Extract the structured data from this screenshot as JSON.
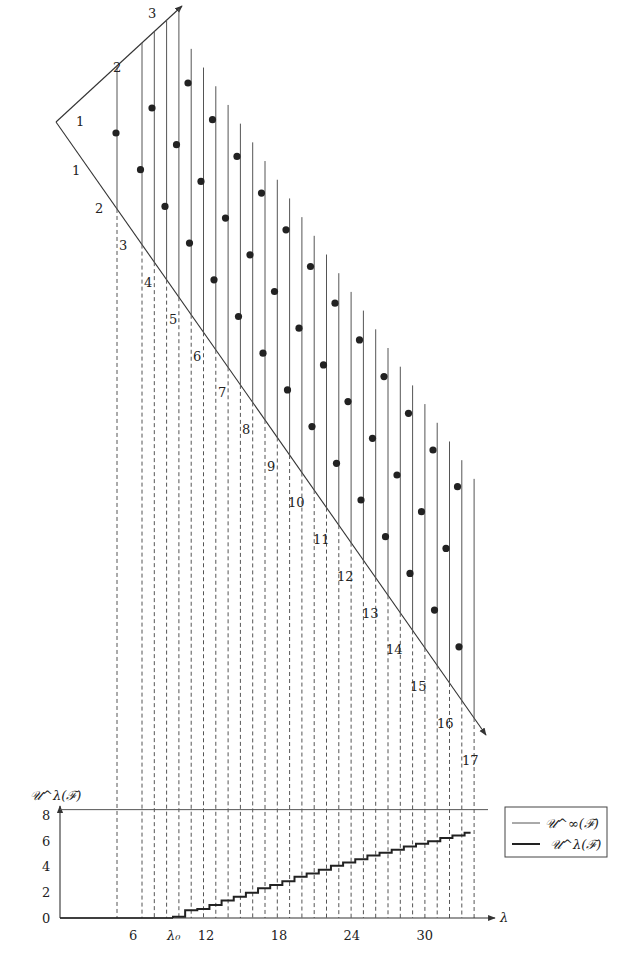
{
  "diagram": {
    "top_edge_labels": [
      "1",
      "2",
      "3"
    ],
    "left_edge_labels": [
      "1",
      "2",
      "3",
      "4",
      "5",
      "6",
      "7",
      "8",
      "9",
      "10",
      "11",
      "12",
      "13",
      "14",
      "15",
      "16",
      "17"
    ],
    "vertical_line_count": 29,
    "dot_rows": 3
  },
  "chart_data": {
    "type": "line",
    "ylabel": "𝒰^λ(ℱ)",
    "xlabel": "λ",
    "ylim": [
      0,
      8.5
    ],
    "yticks": [
      "0",
      "2",
      "4",
      "6",
      "8"
    ],
    "xticks": [
      {
        "value": 6,
        "label": "6"
      },
      {
        "value": 9.3,
        "label": "λ₀"
      },
      {
        "value": 12,
        "label": "12"
      },
      {
        "value": 18,
        "label": "18"
      },
      {
        "value": 24,
        "label": "24"
      },
      {
        "value": 30,
        "label": "30"
      }
    ],
    "xlim": [
      0,
      36
    ],
    "series": [
      {
        "name": "𝒰^∞(ℱ)",
        "style": "thin",
        "constant": 8.4
      },
      {
        "name": "𝒰^λ(ℱ)",
        "style": "thick",
        "x": [
          9.3,
          10.3,
          11.3,
          12.3,
          13.3,
          14.3,
          15.3,
          16.3,
          17.3,
          18.3,
          19.3,
          20.3,
          21.3,
          22.3,
          23.3,
          24.3,
          25.3,
          26.3,
          27.3,
          28.3,
          29.3,
          30.3,
          31.3,
          32.3,
          33.3
        ],
        "y": [
          0.1,
          0.6,
          0.7,
          1.0,
          1.35,
          1.65,
          1.95,
          2.3,
          2.55,
          2.85,
          3.2,
          3.45,
          3.75,
          4.05,
          4.3,
          4.55,
          4.85,
          5.05,
          5.3,
          5.55,
          5.75,
          5.95,
          6.2,
          6.4,
          6.6
        ]
      }
    ],
    "legend": {
      "position": "right",
      "entries": [
        "𝒰^∞(ℱ)",
        "𝒰^λ(ℱ)"
      ]
    }
  }
}
